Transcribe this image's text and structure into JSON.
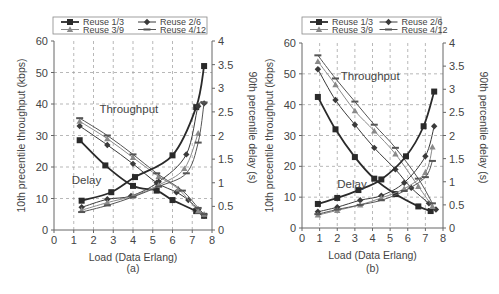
{
  "chart_data": [
    {
      "panel": "(a)",
      "type": "line",
      "xlabel": "Load (Data Erlang)",
      "ylabel": "10th precentile throughput (kbps)",
      "y2label": "90th percentile delay (s)",
      "xlim": [
        0,
        8
      ],
      "ylim": [
        0,
        60
      ],
      "y2lim": [
        0,
        4
      ],
      "xticks": [
        "0",
        "1",
        "2",
        "3",
        "4",
        "5",
        "6",
        "7",
        "8"
      ],
      "yticks": [
        "0",
        "10",
        "20",
        "30",
        "40",
        "50",
        "60"
      ],
      "y2ticks": [
        "0",
        "0.5",
        "1",
        "1.5",
        "2",
        "2.5",
        "3",
        "3.5",
        "4"
      ],
      "grid": true,
      "legend_position": "top",
      "legend": [
        "Reuse 1/3",
        "Reuse 2/6",
        "Reuse 3/9",
        "Reuse 4/12"
      ],
      "annotations": [
        "Throughput",
        "Delay"
      ],
      "series": [
        {
          "name": "Reuse 1/3",
          "metric": "throughput",
          "axis": "left",
          "x": [
            1.3,
            2.6,
            4.0,
            5.2,
            6.0,
            7.2,
            7.6
          ],
          "values": [
            28.5,
            20.5,
            14,
            12.5,
            9.5,
            6,
            4.5
          ]
        },
        {
          "name": "Reuse 2/6",
          "metric": "throughput",
          "axis": "left",
          "x": [
            1.3,
            2.7,
            4.0,
            5.2,
            6.2,
            6.8,
            7.3,
            7.6
          ],
          "values": [
            33,
            27,
            21,
            15,
            12,
            9.5,
            6.5,
            4.5
          ]
        },
        {
          "name": "Reuse 3/9",
          "metric": "throughput",
          "axis": "left",
          "x": [
            1.3,
            2.7,
            4.0,
            5.3,
            6.3,
            7.3,
            7.6
          ],
          "values": [
            34.5,
            29,
            23,
            17,
            13,
            6,
            5
          ]
        },
        {
          "name": "Reuse 4/12",
          "metric": "throughput",
          "axis": "left",
          "x": [
            1.3,
            2.7,
            4.0,
            5.2,
            6.5,
            7.3,
            7.6
          ],
          "values": [
            35.5,
            30,
            24,
            18,
            12.5,
            7,
            5
          ]
        },
        {
          "name": "Reuse 1/3",
          "metric": "delay",
          "axis": "right",
          "x": [
            1.4,
            2.9,
            4.1,
            6.0,
            7.2,
            7.6
          ],
          "values": [
            0.62,
            0.8,
            1.12,
            1.58,
            2.6,
            3.47
          ]
        },
        {
          "name": "Reuse 2/6",
          "metric": "delay",
          "axis": "right",
          "x": [
            1.4,
            2.7,
            3.9,
            5.3,
            6.7,
            7.3,
            7.6
          ],
          "values": [
            0.48,
            0.65,
            0.72,
            1.02,
            1.6,
            2.62,
            2.68
          ]
        },
        {
          "name": "Reuse 3/9",
          "metric": "delay",
          "axis": "right",
          "x": [
            1.4,
            2.7,
            4.0,
            5.3,
            6.6,
            7.3
          ],
          "values": [
            0.42,
            0.58,
            0.72,
            0.95,
            1.3,
            2.05
          ]
        },
        {
          "name": "Reuse 4/12",
          "metric": "delay",
          "axis": "right",
          "x": [
            1.4,
            2.7,
            4.0,
            5.3,
            6.7,
            7.3,
            7.6
          ],
          "values": [
            0.38,
            0.52,
            0.7,
            0.92,
            1.2,
            1.85,
            2.7
          ]
        }
      ]
    },
    {
      "panel": "(b)",
      "type": "line",
      "xlabel": "Load (Data Erlang)",
      "ylabel": "10th precentile throughput (kbps)",
      "y2label": "90th percentile delay (s)",
      "xlim": [
        0,
        8
      ],
      "ylim": [
        0,
        60
      ],
      "y2lim": [
        0,
        4
      ],
      "xticks": [
        "0",
        "1",
        "2",
        "3",
        "4",
        "5",
        "6",
        "7",
        "8"
      ],
      "yticks": [
        "0",
        "10",
        "20",
        "30",
        "40",
        "50",
        "60"
      ],
      "y2ticks": [
        "0",
        "0.5",
        "1",
        "1.5",
        "2",
        "2.5",
        "3",
        "3.5",
        "4"
      ],
      "grid": true,
      "legend_position": "top",
      "legend": [
        "Reuse 1/3",
        "Reuse 2/6",
        "Reuse 3/9",
        "Reuse 4/12"
      ],
      "annotations": [
        "Throughput",
        "Delay"
      ],
      "series": [
        {
          "name": "Reuse 1/3",
          "metric": "throughput",
          "axis": "left",
          "x": [
            0.9,
            1.9,
            3.0,
            4.1,
            5.3,
            6.6,
            7.3
          ],
          "values": [
            42.5,
            32,
            23,
            16,
            11,
            7,
            5.5
          ]
        },
        {
          "name": "Reuse 2/6",
          "metric": "throughput",
          "axis": "left",
          "x": [
            0.9,
            1.9,
            3.0,
            4.1,
            5.3,
            6.2,
            7.2,
            7.6
          ],
          "values": [
            51.5,
            41.5,
            33.5,
            26,
            19,
            13,
            8,
            6
          ]
        },
        {
          "name": "Reuse 3/9",
          "metric": "throughput",
          "axis": "left",
          "x": [
            0.9,
            1.9,
            3.0,
            4.1,
            5.3,
            6.6,
            7.4
          ],
          "values": [
            54,
            46.5,
            38,
            31.5,
            24,
            13.5,
            7
          ]
        },
        {
          "name": "Reuse 4/12",
          "metric": "throughput",
          "axis": "left",
          "x": [
            0.9,
            1.9,
            3.0,
            4.1,
            5.3,
            6.6,
            7.4
          ],
          "values": [
            56,
            48.5,
            41,
            33.5,
            26,
            16,
            8
          ]
        },
        {
          "name": "Reuse 1/3",
          "metric": "delay",
          "axis": "right",
          "x": [
            0.9,
            2.0,
            3.2,
            4.5,
            5.9,
            6.9,
            7.5
          ],
          "values": [
            0.52,
            0.65,
            0.82,
            1.05,
            1.55,
            2.2,
            2.95
          ]
        },
        {
          "name": "Reuse 2/6",
          "metric": "delay",
          "axis": "right",
          "x": [
            0.9,
            2.0,
            3.3,
            4.5,
            5.8,
            7.0,
            7.5
          ],
          "values": [
            0.35,
            0.45,
            0.6,
            0.7,
            0.98,
            1.55,
            2.2
          ]
        },
        {
          "name": "Reuse 3/9",
          "metric": "delay",
          "axis": "right",
          "x": [
            0.9,
            2.0,
            3.3,
            4.5,
            5.8,
            7.0,
            7.4
          ],
          "values": [
            0.28,
            0.38,
            0.5,
            0.65,
            0.85,
            1.2,
            1.75
          ]
        },
        {
          "name": "Reuse 4/12",
          "metric": "delay",
          "axis": "right",
          "x": [
            0.9,
            2.0,
            3.3,
            4.5,
            5.8,
            7.0,
            7.4
          ],
          "values": [
            0.3,
            0.4,
            0.5,
            0.6,
            0.8,
            1.1,
            1.45
          ]
        }
      ]
    }
  ],
  "styles": {
    "Reuse 1/3": {
      "color": "#2a2a2a",
      "width": 1.8,
      "marker": "square"
    },
    "Reuse 2/6": {
      "color": "#3a3a3a",
      "width": 1.0,
      "marker": "diamond"
    },
    "Reuse 3/9": {
      "color": "#8a8a8a",
      "width": 1.0,
      "marker": "triangle"
    },
    "Reuse 4/12": {
      "color": "#555555",
      "width": 1.0,
      "marker": "dash"
    }
  },
  "layout": [
    {
      "plot": {
        "left": 54,
        "top": 41,
        "right": 212,
        "bottom": 230
      },
      "legend": {
        "x": 53,
        "y": 17,
        "w": 154,
        "h": 17
      },
      "anno_throughput": {
        "x": 2.3,
        "y": 37
      },
      "anno_delay": {
        "x": 0.9,
        "y": 14.5
      },
      "caption_y": 272
    },
    {
      "plot": {
        "left": 302,
        "top": 43,
        "right": 443,
        "bottom": 228
      },
      "legend": {
        "x": 302,
        "y": 17,
        "w": 139,
        "h": 17
      },
      "anno_throughput": {
        "x": 2.2,
        "y": 48
      },
      "anno_delay": {
        "x": 2.0,
        "y": 13
      },
      "caption_y": 272
    }
  ],
  "captions": [
    "(a)",
    "(b)"
  ]
}
